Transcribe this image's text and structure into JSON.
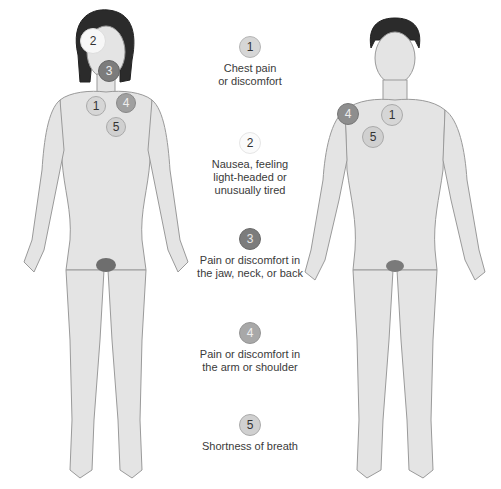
{
  "legend": [
    {
      "number": "1",
      "label": "Chest pain\nor discomfort",
      "fill": "#d6d6d6",
      "border": "#b5b5b5",
      "text_color": "#333333"
    },
    {
      "number": "2",
      "label": "Nausea, feeling\nlight-headed or\nunusually tired",
      "fill": "#fbfbfb",
      "border": "#e6e6e6",
      "text_color": "#333333"
    },
    {
      "number": "3",
      "label": "Pain or discomfort in\nthe jaw, neck, or back",
      "fill": "#7c7c7c",
      "border": "#6a6a6a",
      "text_color": "#e8e8e8"
    },
    {
      "number": "4",
      "label": "Pain or discomfort in\nthe arm or shoulder",
      "fill": "#a8a8a8",
      "border": "#959595",
      "text_color": "#f0f0f0"
    },
    {
      "number": "5",
      "label": "Shortness of breath",
      "fill": "#d0d0d0",
      "border": "#aaaaaa",
      "text_color": "#333333"
    }
  ],
  "female_markers": [
    {
      "number": "2",
      "location": "head"
    },
    {
      "number": "3",
      "location": "jaw"
    },
    {
      "number": "1",
      "location": "chest"
    },
    {
      "number": "4",
      "location": "shoulder"
    },
    {
      "number": "5",
      "location": "lung"
    }
  ],
  "male_markers": [
    {
      "number": "4",
      "location": "shoulder"
    },
    {
      "number": "1",
      "location": "chest"
    },
    {
      "number": "5",
      "location": "lung"
    }
  ]
}
